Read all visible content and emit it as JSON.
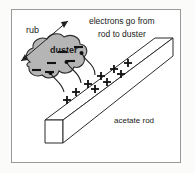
{
  "diagram": {
    "title_caption": "electrons go from rod to duster",
    "labels": {
      "rub": "rub",
      "duster": "duster",
      "acetate_rod": "acetate rod",
      "electrons_line1": "electrons go from",
      "electrons_line2": "rod to duster"
    },
    "charges": {
      "negative_symbol": "−",
      "positive_symbol": "+",
      "negative_count": 6,
      "positive_count": 9,
      "negative_positions": [
        {
          "x": 79,
          "y": 47
        },
        {
          "x": 62,
          "y": 52
        },
        {
          "x": 71,
          "y": 61
        },
        {
          "x": 52,
          "y": 63
        },
        {
          "x": 36,
          "y": 70
        },
        {
          "x": 49,
          "y": 72
        }
      ],
      "positive_positions": [
        {
          "x": 128,
          "y": 63
        },
        {
          "x": 114,
          "y": 69
        },
        {
          "x": 121,
          "y": 73
        },
        {
          "x": 101,
          "y": 76
        },
        {
          "x": 107,
          "y": 81
        },
        {
          "x": 88,
          "y": 84
        },
        {
          "x": 95,
          "y": 88
        },
        {
          "x": 76,
          "y": 92
        },
        {
          "x": 67,
          "y": 99
        }
      ]
    },
    "arrows": {
      "rub_arrow": {
        "type": "double-headed",
        "from": {
          "x": 21,
          "y": 61
        },
        "to": {
          "x": 68,
          "y": 21
        }
      },
      "electron_transfer_count": 3
    },
    "colors": {
      "duster_fill": "#b5b5b5",
      "duster_stroke": "#2b2b2b",
      "rod_fill": "#ffffff",
      "rod_stroke": "#2b2b2b",
      "border": "#9a9a9a",
      "background": "#ffffff",
      "text": "#1a1a1a"
    }
  }
}
